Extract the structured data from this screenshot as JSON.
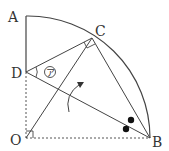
{
  "diagram": {
    "labels": {
      "A": "A",
      "B": "B",
      "C": "C",
      "D": "D",
      "O": "O",
      "angle_mark": "ア"
    },
    "points": {
      "A": [
        26,
        16
      ],
      "B": [
        150,
        138
      ],
      "C": [
        92,
        38
      ],
      "D": [
        26,
        72
      ],
      "O": [
        26,
        138
      ]
    },
    "colors": {
      "stroke": "#444444",
      "dot": "#111111",
      "text": "#333333"
    }
  }
}
